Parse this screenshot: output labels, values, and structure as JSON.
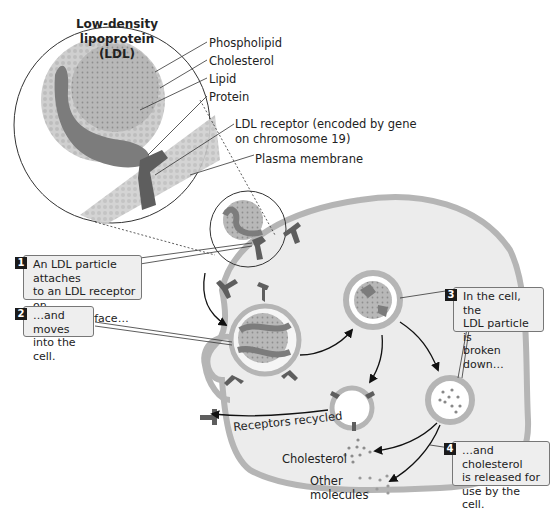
{
  "title": "Low-density lipoprotein (LDL)",
  "title_lines": [
    "Low-density",
    "lipoprotein (LDL)"
  ],
  "inset_labels": {
    "phospholipid": "Phospholipid",
    "cholesterol": "Cholesterol",
    "lipid": "Lipid",
    "protein": "Protein",
    "ldl_receptor_line1": "LDL receptor (encoded by gene",
    "ldl_receptor_line2": "on chromosome 19)",
    "plasma_membrane": "Plasma membrane"
  },
  "steps": [
    {
      "number": "1",
      "lines": [
        "An LDL particle attaches",
        "to an LDL receptor on",
        "the cell surface…"
      ]
    },
    {
      "number": "2",
      "lines": [
        "…and moves",
        "into the cell."
      ]
    },
    {
      "number": "3",
      "lines": [
        "In the cell, the",
        "LDL particle is",
        "broken down…"
      ]
    },
    {
      "number": "4",
      "lines": [
        "…and cholesterol",
        "is released for",
        "use by the cell."
      ]
    }
  ],
  "cell_labels": {
    "receptors_recycled": "Receptors recycled",
    "cholesterol": "Cholesterol",
    "other_molecules_line1": "Other",
    "other_molecules_line2": "molecules"
  },
  "colors": {
    "membrane": "#b5b5b5",
    "cytoplasm": "#ececec",
    "receptor": "#5e5e5e",
    "lipid_core": "#a8a8a8",
    "callout_bg": "#eeeeee",
    "number_badge": "#1a1a1a"
  }
}
